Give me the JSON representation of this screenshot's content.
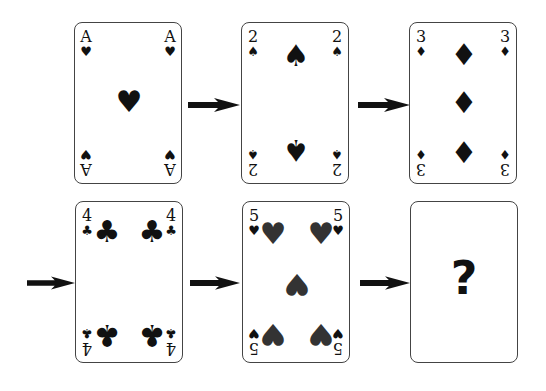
{
  "puzzle": {
    "cards": [
      {
        "rank": "A",
        "suit": "♥",
        "suit_name": "hearts"
      },
      {
        "rank": "2",
        "suit": "♠",
        "suit_name": "spades"
      },
      {
        "rank": "3",
        "suit": "♦",
        "suit_name": "diamonds"
      },
      {
        "rank": "4",
        "suit": "♣",
        "suit_name": "clubs"
      },
      {
        "rank": "5",
        "suit": "♥",
        "suit_name": "hearts"
      },
      {
        "rank": "?",
        "suit": "",
        "suit_name": "unknown"
      }
    ],
    "unknown_label": "?",
    "colors": {
      "card_border": "#444444",
      "ink": "#111111",
      "arrow": "#111111"
    }
  }
}
